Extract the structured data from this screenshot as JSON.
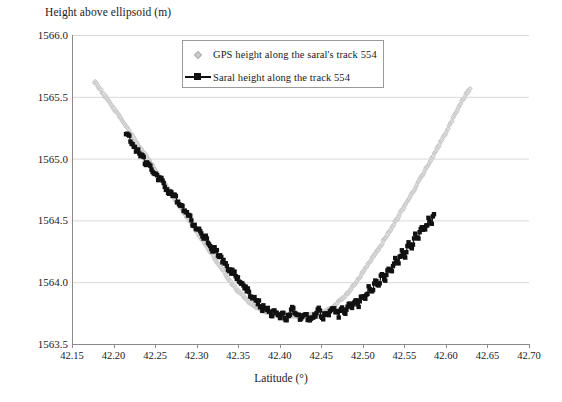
{
  "chart_data": {
    "type": "scatter",
    "title": "",
    "ylabel": "Height above ellipsoid (m)",
    "xlabel": "Latitude (°)",
    "xlim": [
      42.15,
      42.7
    ],
    "ylim": [
      1563.5,
      1566.0
    ],
    "xticks": [
      "42.15",
      "42.20",
      "42.25",
      "42.30",
      "42.35",
      "42.40",
      "42.45",
      "42.50",
      "42.55",
      "42.60",
      "42.65",
      "42.70"
    ],
    "xtick_values": [
      42.15,
      42.2,
      42.25,
      42.3,
      42.35,
      42.4,
      42.45,
      42.5,
      42.55,
      42.6,
      42.65,
      42.7
    ],
    "yticks": [
      "1563.5",
      "1564.0",
      "1564.5",
      "1565.0",
      "1565.5",
      "1566.0"
    ],
    "ytick_values": [
      1563.5,
      1564.0,
      1564.5,
      1565.0,
      1565.5,
      1566.0
    ],
    "grid": "horizontal",
    "legend_position": "upper-center-left",
    "colors": {
      "gps": "#c4c4c4",
      "saral": "#111111",
      "grid": "#d9d9d9",
      "axis": "#8a8a8a"
    },
    "series": [
      {
        "name": "GPS height along the saral's track 554",
        "marker": "diamond",
        "color": "#c4c4c4",
        "x": [
          42.177,
          42.18,
          42.183,
          42.186,
          42.189,
          42.192,
          42.195,
          42.198,
          42.201,
          42.204,
          42.207,
          42.21,
          42.213,
          42.216,
          42.219,
          42.222,
          42.225,
          42.228,
          42.231,
          42.234,
          42.237,
          42.24,
          42.243,
          42.246,
          42.249,
          42.252,
          42.255,
          42.258,
          42.261,
          42.264,
          42.267,
          42.27,
          42.273,
          42.276,
          42.279,
          42.282,
          42.285,
          42.288,
          42.291,
          42.294,
          42.297,
          42.3,
          42.303,
          42.306,
          42.309,
          42.312,
          42.315,
          42.318,
          42.321,
          42.324,
          42.327,
          42.33,
          42.333,
          42.336,
          42.339,
          42.342,
          42.345,
          42.348,
          42.351,
          42.354,
          42.357,
          42.36,
          42.363,
          42.366,
          42.369,
          42.372,
          42.375,
          42.378,
          42.381,
          42.384,
          42.387,
          42.39,
          42.393,
          42.396,
          42.399,
          42.402,
          42.405,
          42.408,
          42.411,
          42.414,
          42.417,
          42.42,
          42.423,
          42.426,
          42.429,
          42.432,
          42.435,
          42.438,
          42.441,
          42.444,
          42.447,
          42.45,
          42.453,
          42.456,
          42.459,
          42.462,
          42.465,
          42.468,
          42.471,
          42.474,
          42.477,
          42.48,
          42.483,
          42.486,
          42.489,
          42.492,
          42.495,
          42.498,
          42.501,
          42.504,
          42.507,
          42.51,
          42.513,
          42.516,
          42.519,
          42.522,
          42.525,
          42.528,
          42.531,
          42.534,
          42.537,
          42.54,
          42.543,
          42.546,
          42.549,
          42.552,
          42.555,
          42.558,
          42.561,
          42.564,
          42.567,
          42.57,
          42.573,
          42.576,
          42.579,
          42.582,
          42.585,
          42.588,
          42.591,
          42.594,
          42.597,
          42.6,
          42.603,
          42.606,
          42.609,
          42.612,
          42.615,
          42.618,
          42.621,
          42.624,
          42.627,
          42.63
        ],
        "y": [
          1565.62,
          1565.6,
          1565.57,
          1565.54,
          1565.51,
          1565.49,
          1565.46,
          1565.43,
          1565.4,
          1565.37,
          1565.34,
          1565.31,
          1565.28,
          1565.25,
          1565.22,
          1565.19,
          1565.16,
          1565.13,
          1565.1,
          1565.07,
          1565.04,
          1565.01,
          1564.98,
          1564.95,
          1564.92,
          1564.89,
          1564.86,
          1564.83,
          1564.8,
          1564.77,
          1564.74,
          1564.71,
          1564.68,
          1564.65,
          1564.62,
          1564.59,
          1564.56,
          1564.53,
          1564.5,
          1564.47,
          1564.44,
          1564.41,
          1564.38,
          1564.35,
          1564.32,
          1564.29,
          1564.26,
          1564.23,
          1564.2,
          1564.17,
          1564.14,
          1564.11,
          1564.08,
          1564.05,
          1564.02,
          1563.99,
          1563.97,
          1563.94,
          1563.92,
          1563.9,
          1563.88,
          1563.86,
          1563.84,
          1563.83,
          1563.81,
          1563.8,
          1563.79,
          1563.78,
          1563.77,
          1563.76,
          1563.755,
          1563.75,
          1563.745,
          1563.74,
          1563.738,
          1563.735,
          1563.733,
          1563.731,
          1563.73,
          1563.729,
          1563.728,
          1563.727,
          1563.727,
          1563.727,
          1563.728,
          1563.729,
          1563.731,
          1563.733,
          1563.736,
          1563.74,
          1563.745,
          1563.75,
          1563.76,
          1563.77,
          1563.78,
          1563.79,
          1563.8,
          1563.82,
          1563.84,
          1563.86,
          1563.88,
          1563.9,
          1563.92,
          1563.95,
          1563.97,
          1564.0,
          1564.03,
          1564.06,
          1564.09,
          1564.12,
          1564.15,
          1564.18,
          1564.21,
          1564.24,
          1564.27,
          1564.3,
          1564.34,
          1564.37,
          1564.4,
          1564.43,
          1564.47,
          1564.5,
          1564.53,
          1564.57,
          1564.6,
          1564.64,
          1564.67,
          1564.71,
          1564.74,
          1564.78,
          1564.81,
          1564.85,
          1564.88,
          1564.92,
          1564.96,
          1564.99,
          1565.03,
          1565.07,
          1565.1,
          1565.14,
          1565.18,
          1565.21,
          1565.25,
          1565.29,
          1565.33,
          1565.37,
          1565.41,
          1565.45,
          1565.48,
          1565.52,
          1565.55,
          1565.57
        ]
      },
      {
        "name": "Saral height along the track 554",
        "marker": "square-line",
        "color": "#111111",
        "x": [
          42.215,
          42.219,
          42.223,
          42.227,
          42.231,
          42.235,
          42.239,
          42.243,
          42.247,
          42.251,
          42.255,
          42.259,
          42.263,
          42.267,
          42.271,
          42.275,
          42.279,
          42.283,
          42.287,
          42.291,
          42.295,
          42.299,
          42.303,
          42.307,
          42.311,
          42.315,
          42.319,
          42.323,
          42.327,
          42.331,
          42.335,
          42.339,
          42.343,
          42.347,
          42.351,
          42.355,
          42.359,
          42.363,
          42.367,
          42.371,
          42.375,
          42.379,
          42.383,
          42.387,
          42.391,
          42.395,
          42.399,
          42.403,
          42.407,
          42.411,
          42.415,
          42.419,
          42.423,
          42.427,
          42.431,
          42.435,
          42.439,
          42.443,
          42.447,
          42.451,
          42.455,
          42.459,
          42.463,
          42.467,
          42.471,
          42.475,
          42.479,
          42.483,
          42.487,
          42.491,
          42.495,
          42.499,
          42.503,
          42.507,
          42.511,
          42.515,
          42.519,
          42.523,
          42.527,
          42.531,
          42.535,
          42.539,
          42.543,
          42.547,
          42.551,
          42.555,
          42.559,
          42.563,
          42.567,
          42.571,
          42.575,
          42.579,
          42.583,
          42.587
        ],
        "y": [
          1565.19,
          1565.17,
          1565.12,
          1565.06,
          1565.05,
          1565.01,
          1564.96,
          1564.95,
          1564.9,
          1564.88,
          1564.83,
          1564.82,
          1564.76,
          1564.73,
          1564.7,
          1564.68,
          1564.61,
          1564.6,
          1564.56,
          1564.54,
          1564.48,
          1564.45,
          1564.42,
          1564.38,
          1564.36,
          1564.3,
          1564.27,
          1564.26,
          1564.21,
          1564.17,
          1564.16,
          1564.09,
          1564.08,
          1564.06,
          1564.0,
          1563.98,
          1563.96,
          1563.92,
          1563.87,
          1563.86,
          1563.83,
          1563.79,
          1563.8,
          1563.76,
          1563.74,
          1563.77,
          1563.72,
          1563.75,
          1563.7,
          1563.73,
          1563.8,
          1563.76,
          1563.72,
          1563.7,
          1563.75,
          1563.69,
          1563.73,
          1563.71,
          1563.78,
          1563.7,
          1563.74,
          1563.72,
          1563.8,
          1563.76,
          1563.73,
          1563.79,
          1563.75,
          1563.84,
          1563.8,
          1563.86,
          1563.82,
          1563.9,
          1563.87,
          1563.95,
          1563.91,
          1564.0,
          1563.98,
          1564.06,
          1564.03,
          1564.12,
          1564.1,
          1564.18,
          1564.16,
          1564.25,
          1564.22,
          1564.31,
          1564.29,
          1564.38,
          1564.36,
          1564.45,
          1564.42,
          1564.51,
          1564.49,
          1564.58
        ]
      }
    ]
  },
  "legend": {
    "gps_label": "GPS height along the saral's track 554",
    "saral_label": "Saral height along the track 554"
  }
}
